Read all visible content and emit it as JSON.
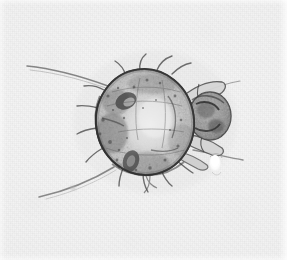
{
  "image": {
    "kind": "light-microscopy-photomicrograph",
    "subject_label": "mite",
    "view": "dorsal whole mount",
    "background_color": "#f1f1f1",
    "specimen_tone": "#8d8d8d",
    "outline_color": "#3a3a3a",
    "dark_patch_color": "#4a4a4a",
    "highlight_color": "#fbfbfb",
    "width": 287,
    "height": 260
  },
  "specimen": {
    "body": {
      "name": "idiosoma",
      "center_x": 145,
      "center_y": 122,
      "radius_x": 49,
      "radius_y": 53,
      "rotation_deg": -8,
      "fill": "#c9c9c9",
      "stroke": "#4b4b4b"
    },
    "gnathosoma": {
      "name": "mouthparts",
      "center_x": 210,
      "center_y": 116,
      "radius_x": 21,
      "radius_y": 24,
      "fill": "#a6a6a6"
    },
    "legs": [
      {
        "name": "leg-1-right-upper",
        "x1": 186,
        "y1": 99,
        "x2": 229,
        "y2": 86
      },
      {
        "name": "leg-2-right-mid",
        "x1": 189,
        "y1": 118,
        "x2": 233,
        "y2": 118
      },
      {
        "name": "leg-3-right-lower",
        "x1": 186,
        "y1": 138,
        "x2": 230,
        "y2": 150
      },
      {
        "name": "leg-4-right-rear",
        "x1": 180,
        "y1": 152,
        "x2": 214,
        "y2": 166
      }
    ],
    "long_setae": [
      {
        "name": "seta-anterior-left",
        "x1": 106,
        "y1": 85,
        "x2": 28,
        "y2": 67
      },
      {
        "name": "seta-posterior-left",
        "x1": 112,
        "y1": 168,
        "x2": 40,
        "y2": 196
      },
      {
        "name": "seta-posterior-right",
        "x1": 196,
        "y1": 152,
        "x2": 241,
        "y2": 161
      }
    ],
    "dark_structures": [
      {
        "name": "dark-organ-upper-left",
        "cx": 126,
        "cy": 101,
        "rx": 11,
        "ry": 8,
        "rot": -25
      },
      {
        "name": "dark-organ-lower-left",
        "cx": 131,
        "cy": 161,
        "rx": 8,
        "ry": 11,
        "rot": 18
      },
      {
        "name": "dark-mass-left-flank",
        "cx": 112,
        "cy": 133,
        "rx": 16,
        "ry": 20,
        "rot": 0
      }
    ],
    "debris": {
      "name": "bright-debris-particle",
      "cx": 215,
      "cy": 164,
      "rx": 6,
      "ry": 9
    },
    "marginal_spine_count": 14
  }
}
